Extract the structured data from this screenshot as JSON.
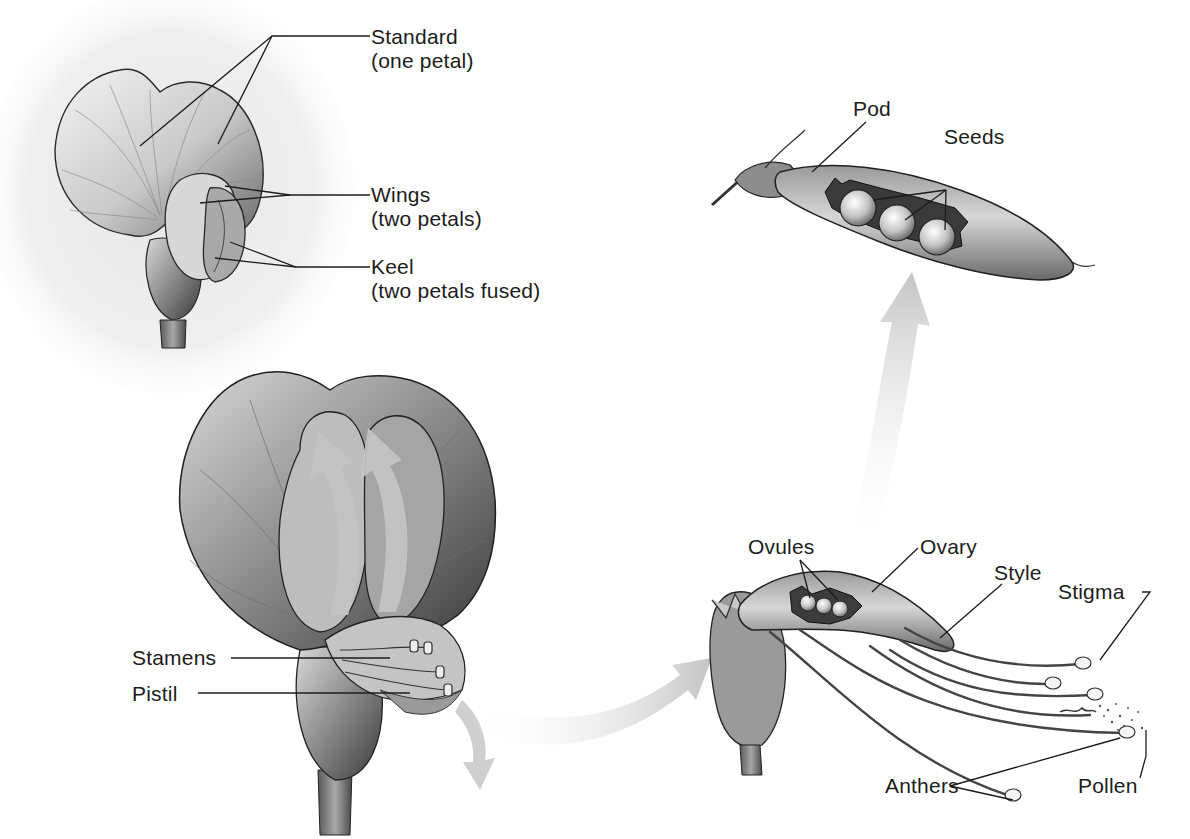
{
  "diagram": {
    "panels": {
      "flower_exterior": {
        "labels": {
          "standard": {
            "title": "Standard",
            "note": "(one petal)"
          },
          "wings": {
            "title": "Wings",
            "note": "(two petals)"
          },
          "keel": {
            "title": "Keel",
            "note": "(two petals fused)"
          }
        }
      },
      "flower_open": {
        "labels": {
          "stamens": "Stamens",
          "pistil": "Pistil"
        }
      },
      "pod": {
        "labels": {
          "pod": "Pod",
          "seeds": "Seeds"
        },
        "seed_count": 3
      },
      "pistil_detail": {
        "labels": {
          "ovules": "Ovules",
          "ovary": "Ovary",
          "style": "Style",
          "stigma": "Stigma",
          "anthers": "Anthers",
          "pollen": "Pollen"
        },
        "ovule_count": 3
      }
    },
    "colors": {
      "ink": "#1c1c1c",
      "petal_light": "#e9e9e9",
      "petal_mid": "#b5b5b5",
      "petal_dark": "#555555",
      "arrow": "#c8c8c8",
      "background_wash": "#ececec"
    },
    "arrows": [
      {
        "name": "open-flower-to-pistil-arrow",
        "direction": "right"
      },
      {
        "name": "pistil-to-pod-arrow",
        "direction": "up"
      },
      {
        "name": "keel-opening-arrow-left",
        "direction": "up"
      },
      {
        "name": "keel-opening-arrow-right",
        "direction": "up"
      },
      {
        "name": "pollen-drop-arrow",
        "direction": "down"
      }
    ]
  }
}
